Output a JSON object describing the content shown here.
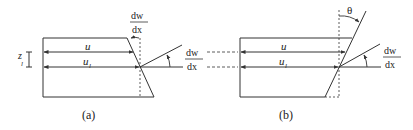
{
  "figure": {
    "panels": [
      {
        "id": "a",
        "caption": "(a)",
        "labels": {
          "u": "u",
          "u_l_base": "u",
          "u_l_sub": "l",
          "z_l_base": "z",
          "z_l_sub": "l",
          "top_slope_num": "dw",
          "top_slope_den": "dx",
          "right_slope_num": "dw",
          "right_slope_den": "dx"
        }
      },
      {
        "id": "b",
        "caption": "(b)",
        "labels": {
          "theta": "θ",
          "u": "u",
          "u_l_base": "u",
          "u_l_sub": "l",
          "right_slope_num": "dw",
          "right_slope_den": "dx"
        }
      }
    ],
    "colors": {
      "line": "#333333",
      "background": "#ffffff"
    }
  }
}
